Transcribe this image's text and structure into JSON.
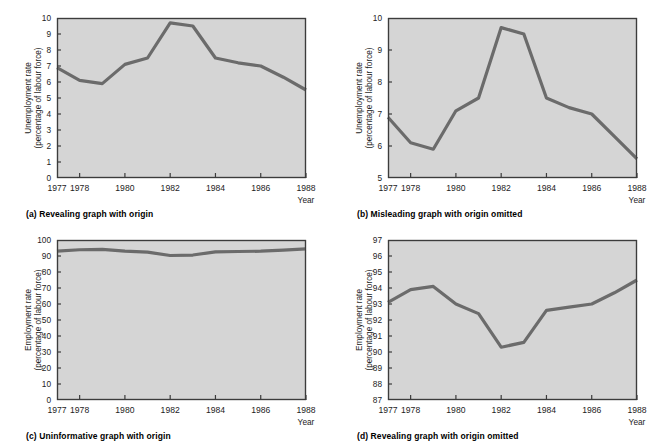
{
  "figure": {
    "panel_count": 4,
    "plot_bg_color": "#d5d5d5",
    "line_color": "#6b6b6b",
    "frame_color": "#3c3c3c",
    "page_bg_color": "#ffffff"
  },
  "panels": [
    {
      "key": "a",
      "caption": "(a) Revealing graph with origin",
      "ylabel_line1": "Unemployment rate",
      "ylabel_line2": "(percentage of labour force)",
      "xlabel": "Year",
      "chart_data": {
        "type": "line",
        "title": "(a) Revealing graph with origin",
        "xlabel": "Year",
        "ylabel": "Unemployment rate (percentage of labour force)",
        "x": [
          1977,
          1978,
          1979,
          1980,
          1981,
          1982,
          1983,
          1984,
          1985,
          1986,
          1987,
          1988
        ],
        "values": [
          6.9,
          6.1,
          5.9,
          7.1,
          7.5,
          9.7,
          9.5,
          7.5,
          7.2,
          7.0,
          6.3,
          5.5
        ],
        "xtick_labels": [
          "1977",
          "1978",
          "1980",
          "1982",
          "1984",
          "1986",
          "1988"
        ],
        "xticks": [
          1977,
          1978,
          1980,
          1982,
          1984,
          1986,
          1988
        ],
        "yticks": [
          0,
          1,
          2,
          3,
          4,
          5,
          6,
          7,
          8,
          9,
          10
        ],
        "ytick_labels": [
          "0",
          "1",
          "2",
          "3",
          "4",
          "5",
          "6",
          "7",
          "8",
          "9",
          "10"
        ],
        "xlim": [
          1977,
          1988
        ],
        "ylim": [
          0,
          10
        ],
        "grid": false,
        "legend": "none"
      }
    },
    {
      "key": "b",
      "caption": "(b) Misleading graph with origin omitted",
      "ylabel_line1": "Unemployment rate",
      "ylabel_line2": "(percentage of labour force)",
      "xlabel": "Year",
      "chart_data": {
        "type": "line",
        "title": "(b) Misleading graph with origin omitted",
        "xlabel": "Year",
        "ylabel": "Unemployment rate (percentage of labour force)",
        "x": [
          1977,
          1978,
          1979,
          1980,
          1981,
          1982,
          1983,
          1984,
          1985,
          1986,
          1987,
          1988
        ],
        "values": [
          6.9,
          6.1,
          5.9,
          7.1,
          7.5,
          9.7,
          9.5,
          7.5,
          7.2,
          7.0,
          6.3,
          5.6
        ],
        "xtick_labels": [
          "1977",
          "1978",
          "1980",
          "1982",
          "1984",
          "1986",
          "1988"
        ],
        "xticks": [
          1977,
          1978,
          1980,
          1982,
          1984,
          1986,
          1988
        ],
        "yticks": [
          5,
          6,
          7,
          8,
          9,
          10
        ],
        "ytick_labels": [
          "5",
          "6",
          "7",
          "8",
          "9",
          "10"
        ],
        "xlim": [
          1977,
          1988
        ],
        "ylim": [
          5,
          10
        ],
        "grid": false,
        "legend": "none"
      }
    },
    {
      "key": "c",
      "caption": "(c) Uninformative graph with origin",
      "ylabel_line1": "Employment rate",
      "ylabel_line2": "(percentage of labour force)",
      "xlabel": "Year",
      "chart_data": {
        "type": "line",
        "title": "(c) Uninformative graph with origin",
        "xlabel": "Year",
        "ylabel": "Employment rate (percentage of labour force)",
        "x": [
          1977,
          1978,
          1979,
          1980,
          1981,
          1982,
          1983,
          1984,
          1985,
          1986,
          1987,
          1988
        ],
        "values": [
          93.1,
          93.9,
          94.1,
          93.0,
          92.4,
          90.3,
          90.6,
          92.6,
          92.8,
          93.0,
          93.7,
          94.5
        ],
        "xtick_labels": [
          "1977",
          "1978",
          "1980",
          "1982",
          "1984",
          "1986",
          "1988"
        ],
        "xticks": [
          1977,
          1978,
          1980,
          1982,
          1984,
          1986,
          1988
        ],
        "yticks": [
          0,
          10,
          20,
          30,
          40,
          50,
          60,
          70,
          80,
          90,
          100
        ],
        "ytick_labels": [
          "0",
          "10",
          "20",
          "30",
          "40",
          "50",
          "60",
          "70",
          "80",
          "90",
          "100"
        ],
        "xlim": [
          1977,
          1988
        ],
        "ylim": [
          0,
          100
        ],
        "grid": false,
        "legend": "none"
      }
    },
    {
      "key": "d",
      "caption": "(d) Revealing graph with origin omitted",
      "ylabel_line1": "Employment rate",
      "ylabel_line2": "(percentage of labour force)",
      "xlabel": "Year",
      "chart_data": {
        "type": "line",
        "title": "(d) Revealing graph with origin omitted",
        "xlabel": "Year",
        "ylabel": "Employment rate (percentage of labour force)",
        "x": [
          1977,
          1978,
          1979,
          1980,
          1981,
          1982,
          1983,
          1984,
          1985,
          1986,
          1987,
          1988
        ],
        "values": [
          93.1,
          93.9,
          94.1,
          93.0,
          92.4,
          90.3,
          90.6,
          92.6,
          92.8,
          93.0,
          93.7,
          94.5
        ],
        "xtick_labels": [
          "1977",
          "1978",
          "1980",
          "1982",
          "1984",
          "1986",
          "1988"
        ],
        "xticks": [
          1977,
          1978,
          1980,
          1982,
          1984,
          1986,
          1988
        ],
        "yticks": [
          87,
          88,
          89,
          90,
          91,
          92,
          93,
          94,
          95,
          96,
          97
        ],
        "ytick_labels": [
          "87",
          "88",
          "89",
          "90",
          "91",
          "92",
          "93",
          "94",
          "95",
          "96",
          "97"
        ],
        "xlim": [
          1977,
          1988
        ],
        "ylim": [
          87,
          97
        ],
        "grid": false,
        "legend": "none"
      }
    }
  ]
}
